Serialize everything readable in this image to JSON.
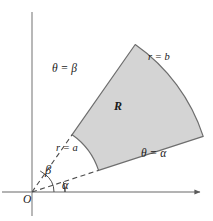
{
  "figure": {
    "background_color": "#ffffff",
    "region_fill_color": "#d4d4d4",
    "region_stroke_color": "#6e6e6e",
    "axis_color": "#8c8c8c",
    "dashed_color": "#4d4d4d",
    "text_color": "#1a1a1a"
  },
  "labels": {
    "origin": "O",
    "alpha_angle": "α",
    "beta_angle": "β",
    "theta_equals_beta": "θ = β",
    "theta_equals_alpha": "θ = α",
    "r_equals_a": "r = a",
    "r_equals_b": "r = b",
    "region": "R"
  },
  "geometry": {
    "origin_x": 32,
    "origin_y": 192,
    "alpha_degrees": 18,
    "beta_degrees": 55,
    "inner_radius_a": 70,
    "outer_radius_b": 180,
    "x_axis_end_x": 202,
    "y_axis_top_y": 12,
    "alpha_arc_radius": 33,
    "beta_arc_radius": 22
  }
}
